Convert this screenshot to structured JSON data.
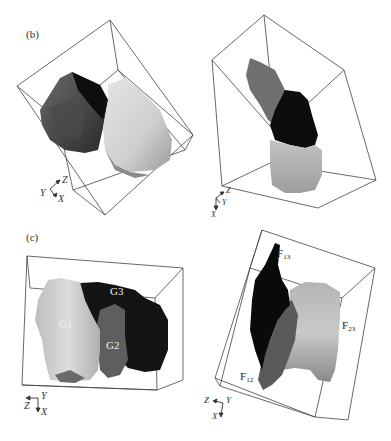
{
  "figure": {
    "panels": [
      {
        "id": "b",
        "label": "(b)",
        "views": [
          {
            "name": "left-view",
            "axes": {
              "z": "Z",
              "y": "Y",
              "x": "X"
            }
          },
          {
            "name": "right-view",
            "axes": {
              "z": "Z",
              "y": "Y",
              "x": "X"
            }
          }
        ]
      },
      {
        "id": "c",
        "label": "(c)",
        "views": [
          {
            "name": "left-view",
            "grains": {
              "g1": "G1",
              "g2": "G2",
              "g3": "G3"
            },
            "axes": {
              "z": "Z",
              "y": "Y",
              "x": "X"
            }
          },
          {
            "name": "right-view",
            "faces": {
              "f13": {
                "main": "F",
                "sub": "13"
              },
              "f23": {
                "main": "F",
                "sub": "23"
              },
              "f12": {
                "main": "F",
                "sub": "12"
              }
            },
            "axes": {
              "z": "Z",
              "y": "Y",
              "x": "X"
            }
          }
        ]
      }
    ],
    "colors": {
      "box_line": "#333333",
      "grain_black": "#111111",
      "grain_dark": "#3a3a3a",
      "grain_mid": "#7a7a7a",
      "grain_light": "#c8c8c8",
      "grain_lighter": "#dadada"
    }
  }
}
